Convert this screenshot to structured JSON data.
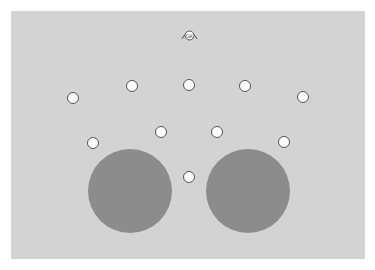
{
  "board": {
    "background": "#d3d3d3",
    "badge": {
      "label": "GK",
      "icon": "goalkeeper-icon"
    }
  },
  "spots": [
    {
      "x": 73,
      "y": 98
    },
    {
      "x": 132,
      "y": 86
    },
    {
      "x": 189,
      "y": 85
    },
    {
      "x": 245,
      "y": 86
    },
    {
      "x": 303,
      "y": 97
    },
    {
      "x": 93,
      "y": 143
    },
    {
      "x": 161,
      "y": 132
    },
    {
      "x": 217,
      "y": 132
    },
    {
      "x": 284,
      "y": 142
    },
    {
      "x": 189,
      "y": 177
    }
  ],
  "pads": [
    {
      "x": 130,
      "y": 191,
      "r": 42,
      "color": "#8c8c8c"
    },
    {
      "x": 248,
      "y": 191,
      "r": 42,
      "color": "#8c8c8c"
    }
  ]
}
